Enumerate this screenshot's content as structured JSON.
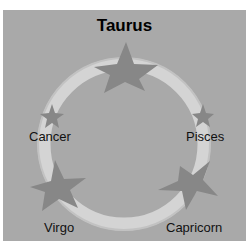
{
  "title": "Taurus",
  "nodes": [
    {
      "id": "taurus",
      "label": "Taurus",
      "position": "top"
    },
    {
      "id": "pisces",
      "label": "Pisces",
      "position": "right"
    },
    {
      "id": "capricorn",
      "label": "Capricorn",
      "position": "bottom-right"
    },
    {
      "id": "virgo",
      "label": "Virgo",
      "position": "bottom-left"
    },
    {
      "id": "cancer",
      "label": "Cancer",
      "position": "left"
    }
  ],
  "colors": {
    "background": "#a9a9a9",
    "ring": "#d6d6d6",
    "star": "#868686",
    "text": "#111111"
  }
}
